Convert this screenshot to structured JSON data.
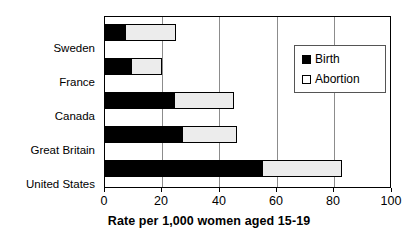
{
  "chart_data": {
    "type": "bar",
    "orientation": "horizontal",
    "stacked": true,
    "title": "",
    "xlabel": "Rate per 1,000 women aged 15-19",
    "ylabel": "",
    "xlim": [
      0,
      100
    ],
    "xticks": [
      0,
      20,
      40,
      60,
      80,
      100
    ],
    "xtick_labels": [
      "0",
      "20",
      "40",
      "60",
      "80",
      "100"
    ],
    "grid": true,
    "grid_axis": "x",
    "legend_position": "upper right",
    "categories": [
      "Sweden",
      "France",
      "Canada",
      "Great Britain",
      "United States"
    ],
    "series": [
      {
        "name": "Birth",
        "color": "#000000",
        "values": [
          7,
          9,
          24,
          27,
          55
        ]
      },
      {
        "name": "Abortion",
        "color": "#ececec",
        "values": [
          18,
          11,
          21,
          19,
          28
        ]
      }
    ],
    "totals": [
      25,
      20,
      45,
      46,
      83
    ]
  },
  "legend": {
    "items": [
      {
        "label": "Birth",
        "swatch": "filled-square-icon"
      },
      {
        "label": "Abortion",
        "swatch": "hollow-square-icon"
      }
    ]
  }
}
